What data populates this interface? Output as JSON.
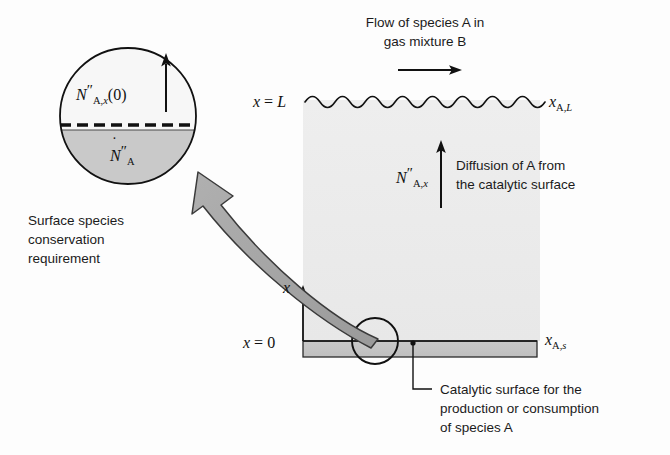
{
  "figure": {
    "background_color": "#fdfdfd",
    "gas_region_color": "#ececec",
    "plate_color": "#c6c6c6",
    "arrow_fill_color": "#a8a8a8",
    "line_color": "#111111"
  },
  "labels": {
    "flow_caption_line1": "Flow of species A in",
    "flow_caption_line2": "gas mixture B",
    "diffusion_caption_line1": "Diffusion of A from",
    "diffusion_caption_line2": "the catalytic surface",
    "surface_caption_line1": "Surface species",
    "surface_caption_line2": "conservation",
    "surface_caption_line3": "requirement",
    "catalytic_caption_line1": "Catalytic surface for the",
    "catalytic_caption_line2": "production or consumption",
    "catalytic_caption_line3": "of species A"
  },
  "symbols": {
    "x_equals_L": {
      "var": "x",
      "eq": " = ",
      "value": "L"
    },
    "x_equals_0": {
      "var": "x",
      "eq": " = ",
      "value": "0"
    },
    "axis_x": "x",
    "mole_fraction_L": {
      "base": "x",
      "sub": "A,",
      "sub_italic": "L"
    },
    "mole_fraction_s": {
      "base": "x",
      "sub": "A,",
      "sub_italic": "s"
    },
    "flux_diffusion": {
      "base": "N",
      "primes": "″",
      "sub": "A,",
      "sub_italic": "x"
    },
    "flux_at_zero": {
      "base": "N",
      "primes": "″",
      "sub": "A,",
      "sub_italic": "x",
      "arg": "(0)"
    },
    "surface_reaction_rate": {
      "base": "N",
      "dot": "˙",
      "primes": "″",
      "sub": "A"
    }
  },
  "geometry": {
    "gas_region": {
      "x": 303,
      "y": 100,
      "width": 237,
      "height": 241
    },
    "plate": {
      "x": 303,
      "y": 341,
      "width": 234,
      "height": 16
    },
    "wavy_boundary": {
      "x_start": 305,
      "x_end": 543,
      "y": 100
    },
    "inset_circle": {
      "cx": 128,
      "cy": 116,
      "r": 68
    },
    "inset_divider_y": 128,
    "source_circle": {
      "cx": 375,
      "cy": 341,
      "r": 23
    },
    "axis_arrow": {
      "x": 303,
      "y_bottom": 341,
      "y_top": 288
    },
    "flow_arrow": {
      "x_start": 398,
      "x_end": 460,
      "y": 70
    },
    "diffusion_arrow": {
      "x": 441,
      "y_bottom": 208,
      "y_top": 143
    },
    "inset_arrow": {
      "x": 166,
      "y_bottom": 110,
      "y_top": 58
    },
    "leader_line": {
      "x": 413,
      "y_top": 345,
      "y_bottom": 388,
      "x_end": 432
    }
  }
}
